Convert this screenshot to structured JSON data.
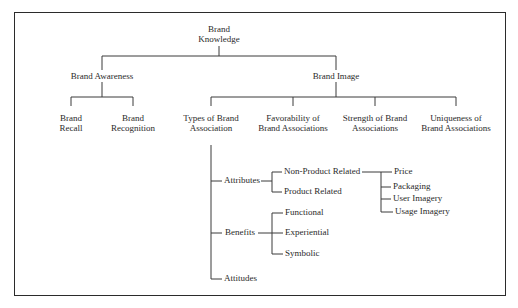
{
  "diagram": {
    "root": {
      "label": "Brand\nKnowledge",
      "line1": "Brand",
      "line2": "Knowledge"
    },
    "level1": {
      "awareness": {
        "label": "Brand Awareness"
      },
      "image": {
        "label": "Brand Image"
      }
    },
    "awareness_children": [
      {
        "line1": "Brand",
        "line2": "Recall"
      },
      {
        "line1": "Brand",
        "line2": "Recognition"
      }
    ],
    "image_children": [
      {
        "line1": "Types of Brand",
        "line2": "Association"
      },
      {
        "line1": "Favorability of",
        "line2": "Brand Associations"
      },
      {
        "line1": "Strength of Brand",
        "line2": "Associations"
      },
      {
        "line1": "Uniqueness of",
        "line2": "Brand Associations"
      }
    ],
    "association_types": [
      {
        "label": "Attributes"
      },
      {
        "label": "Benefits"
      },
      {
        "label": "Attitudes"
      }
    ],
    "attributes": [
      {
        "label": "Non-Product Related"
      },
      {
        "label": "Product Related"
      }
    ],
    "non_product_related": [
      {
        "label": "Price"
      },
      {
        "label": "Packaging"
      },
      {
        "label": "User Imagery"
      },
      {
        "label": "Usage Imagery"
      }
    ],
    "benefits": [
      {
        "label": "Functional"
      },
      {
        "label": "Experiential"
      },
      {
        "label": "Symbolic"
      }
    ]
  }
}
